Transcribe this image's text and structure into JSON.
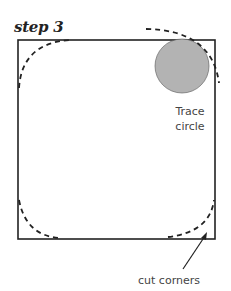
{
  "title": "step 3",
  "labels": {
    "trace_line1": "Trace",
    "trace_line2": "circle",
    "cut_corners": "cut corners"
  },
  "colors": {
    "stroke": "#222222",
    "circle_fill": "#b3b3b3"
  }
}
